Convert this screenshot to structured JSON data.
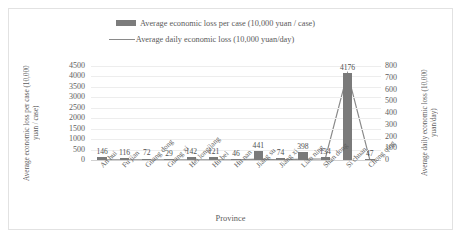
{
  "chart_data": {
    "type": "bar",
    "title": "",
    "xlabel": "Province",
    "ylabel": "Average economic loss per case (10,000 yuan / case)",
    "y2label": "Average daily economic loss (10,000 yuan/day)",
    "categories": [
      "An hui",
      "Fu jian",
      "Guang dong",
      "Guang xi",
      "Hei longjiang",
      "Hu bei",
      "Hu nan",
      "Jiang su",
      "Jiang xi",
      "Liao ning",
      "Shan dong",
      "Si chuan",
      "Chong qing"
    ],
    "series": [
      {
        "name": "Average economic loss per case (10,000 yuan / case)",
        "type": "bar",
        "axis": "left",
        "color": "#7a7a7a",
        "values": [
          146,
          116,
          72,
          29,
          142,
          121,
          46,
          441,
          74,
          398,
          134,
          4176,
          47
        ]
      },
      {
        "name": "Average daily economic loss (10,000 yuan/day)",
        "type": "line",
        "axis": "right",
        "color": "#8a8a8a",
        "values": [
          2,
          2,
          1,
          1,
          2,
          2,
          1,
          8,
          1,
          7,
          9,
          740,
          1
        ]
      }
    ],
    "data_labels": [
      "146",
      "116",
      "72",
      "29",
      "142",
      "121",
      "46",
      "441",
      "74",
      "398",
      "134",
      "4176",
      "47"
    ],
    "ylim": [
      0,
      4500
    ],
    "yticks": [
      "4500",
      "4000",
      "3500",
      "3000",
      "2500",
      "2000",
      "1500",
      "1000",
      "500",
      "0"
    ],
    "y2lim": [
      0,
      800
    ],
    "y2ticks": [
      "800",
      "700",
      "600",
      "500",
      "400",
      "300",
      "200",
      "100",
      "0"
    ],
    "grid": true,
    "legend_position": "top"
  },
  "legend": {
    "bar_label": "Average economic loss per case (10,000 yuan / case)",
    "line_label": "Average daily economic loss (10,000 yuan/day)"
  }
}
